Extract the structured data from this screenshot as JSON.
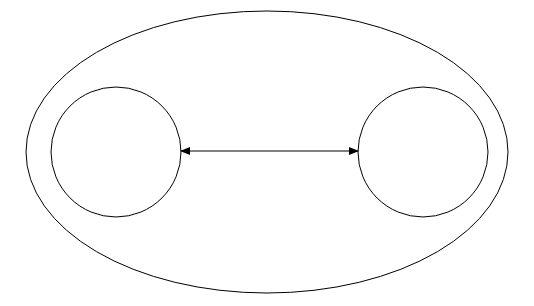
{
  "diagram": {
    "outer_ellipse": {
      "cx": 267,
      "cy": 152,
      "rx": 241,
      "ry": 141
    },
    "left_circle": {
      "cx": 116,
      "cy": 152,
      "r": 65
    },
    "right_circle": {
      "cx": 423,
      "cy": 152,
      "r": 65
    },
    "connector": {
      "x1": 181,
      "x2": 358,
      "y": 151,
      "type": "bidirectional-arrow"
    },
    "stroke_color": "#000000",
    "background": "#ffffff"
  }
}
